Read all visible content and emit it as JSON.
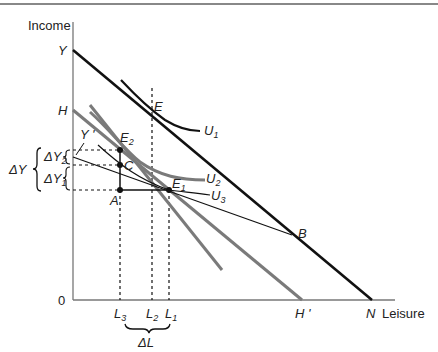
{
  "figure": {
    "type": "labor-leisure income/substitution effect diagram",
    "top_rule_color": "#888888"
  },
  "axes": {
    "y_label": "Income",
    "x_label": "Leisure",
    "origin_label": "0"
  },
  "points": {
    "Y": "Y",
    "H": "H",
    "E": "E",
    "E2": "E",
    "E2_sub": "2",
    "C": "C",
    "A": "A",
    "E1": "E",
    "E1_sub": "1",
    "B": "B",
    "Y_prime": "Y '",
    "H_prime": "H '",
    "N": "N"
  },
  "curves": {
    "U1": "U",
    "U1_sub": "1",
    "U2": "U",
    "U2_sub": "2",
    "U3": "U",
    "U3_sub": "3"
  },
  "x_ticks": {
    "L3": "L",
    "L3_sub": "3",
    "L2": "L",
    "L2_sub": "2",
    "L1": "L",
    "L1_sub": "1"
  },
  "annotations": {
    "delta_Y": "ΔY",
    "delta_Y1": "ΔY",
    "delta_Y1_sub": "1",
    "delta_Y2": "ΔY",
    "delta_Y2_sub": "2",
    "delta_L": "ΔL"
  },
  "colors": {
    "black_line": "#111111",
    "gray_line": "#7a7a7a",
    "axis": "#666666"
  }
}
